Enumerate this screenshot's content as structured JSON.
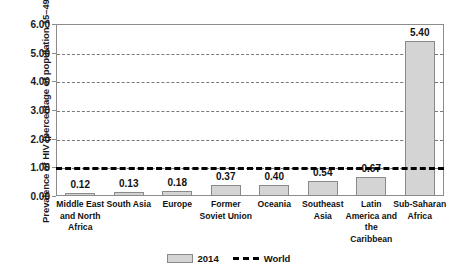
{
  "chart_data": {
    "type": "bar",
    "title": "",
    "xlabel": "",
    "ylabel": "Prevalence of HIV (percentage of population 15–49)",
    "ylim": [
      0,
      6
    ],
    "ytick_labels": [
      "0.00",
      "1.00",
      "2.00",
      "3.00",
      "4.00",
      "5.00",
      "6.00"
    ],
    "ytick_values": [
      0,
      1,
      2,
      3,
      4,
      5,
      6
    ],
    "grid": true,
    "grid_axis": "y",
    "legend_position": "bottom",
    "categories": [
      "Middle East and North Africa",
      "South Asia",
      "Europe",
      "Former Soviet Union",
      "Oceania",
      "Southeast Asia",
      "Latin America and the Caribbean",
      "Sub-Saharan Africa"
    ],
    "category_label_lines": [
      [
        "Middle East",
        "and North",
        "Africa"
      ],
      [
        "South Asia"
      ],
      [
        "Europe"
      ],
      [
        "Former",
        "Soviet Union"
      ],
      [
        "Oceania"
      ],
      [
        "Southeast",
        "Asia"
      ],
      [
        "Latin",
        "America and",
        "the",
        "Caribbean"
      ],
      [
        "Sub-Saharan",
        "Africa"
      ]
    ],
    "values": [
      0.12,
      0.13,
      0.18,
      0.37,
      0.4,
      0.54,
      0.67,
      5.4
    ],
    "value_labels": [
      "0.12",
      "0.13",
      "0.18",
      "0.37",
      "0.40",
      "0.54",
      "0.67",
      "5.40"
    ],
    "series": [
      {
        "name": "2014",
        "values": [
          0.12,
          0.13,
          0.18,
          0.37,
          0.4,
          0.54,
          0.67,
          5.4
        ]
      }
    ],
    "reference_line": {
      "name": "World",
      "value": 1.0,
      "style": "dashed"
    },
    "colors": {
      "bar_fill": "#d4d4d4",
      "bar_border": "#8a8a8a",
      "reference_line": "#000000",
      "grid": "#7a7a7a",
      "text": "#111111"
    }
  },
  "legend": {
    "items": [
      {
        "label": "2014",
        "marker": "swatch"
      },
      {
        "label": "World",
        "marker": "dashed-line"
      }
    ]
  }
}
